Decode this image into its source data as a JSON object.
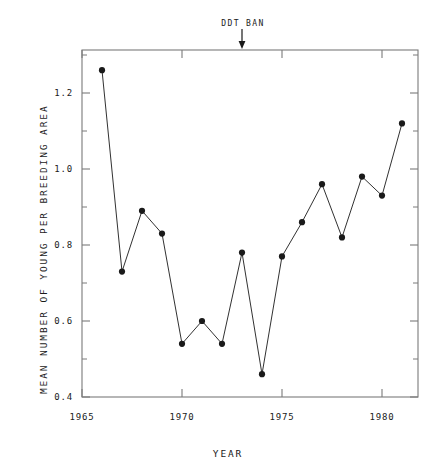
{
  "figure": {
    "cut_off_title_above": "",
    "annotation": {
      "label": "DDT BAN",
      "year": 1973,
      "arrow": "down-arrow"
    },
    "ink_color": "#1a1a1a",
    "axis_color": "#7a7a7a",
    "background": "#ffffff"
  },
  "chart_data": {
    "type": "line",
    "title": "",
    "xlabel": "YEAR",
    "ylabel": "MEAN NUMBER OF YOUNG PER BREEDING AREA",
    "xlim": [
      1964,
      1982
    ],
    "ylim": [
      0.38,
      1.32
    ],
    "xticks": [
      1965,
      1970,
      1975,
      1980
    ],
    "xtick_labels": [
      "1965",
      "1970",
      "1975",
      "1980"
    ],
    "yticks": [
      0.4,
      0.6,
      0.8,
      1.0,
      1.2
    ],
    "ytick_labels": [
      "0.4",
      "0.6",
      "0.8",
      "1.0",
      "1.2"
    ],
    "minor_yticks": [
      0.5,
      0.7,
      0.9,
      1.1,
      1.3
    ],
    "grid": false,
    "legend": null,
    "marker": "filled-circle",
    "x": [
      1966,
      1967,
      1968,
      1969,
      1970,
      1971,
      1972,
      1973,
      1974,
      1975,
      1976,
      1977,
      1978,
      1979,
      1980,
      1981
    ],
    "values": [
      1.26,
      0.73,
      0.89,
      0.83,
      0.54,
      0.6,
      0.54,
      0.78,
      0.46,
      0.77,
      0.86,
      0.96,
      0.82,
      0.98,
      0.93,
      1.12
    ],
    "annotations": [
      {
        "text": "DDT BAN",
        "x": 1973,
        "pointer": "arrow-down"
      }
    ]
  }
}
